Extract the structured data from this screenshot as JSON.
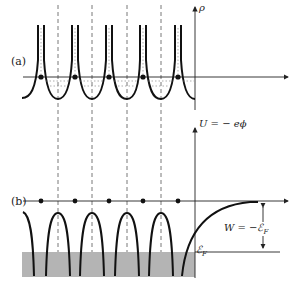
{
  "figure": {
    "panel_a": {
      "label": "(a)",
      "y_axis_label": "ρ",
      "atom_x": [
        41,
        75,
        109,
        143,
        178
      ],
      "cell_boundaries_x": [
        58,
        92,
        127,
        161
      ]
    },
    "panel_b": {
      "label": "(b)",
      "y_axis_label": "U = − eϕ",
      "fermi_label": "ℰ",
      "fermi_sub": "F",
      "work_function_label": "W = −ℰ",
      "work_function_sub": "F",
      "atom_x": [
        41,
        75,
        109,
        143,
        178
      ]
    },
    "colors": {
      "line": "#111111",
      "dashed": "#555555",
      "shade": "#b4b4b4"
    }
  }
}
